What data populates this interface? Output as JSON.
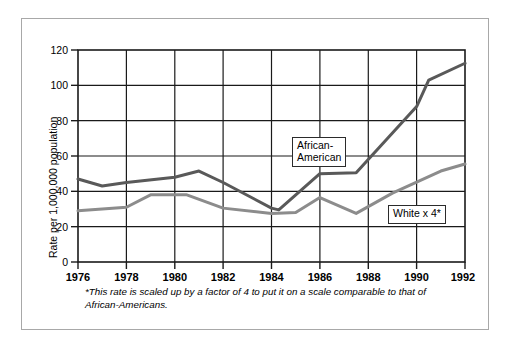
{
  "chart_data": {
    "type": "line",
    "title": "",
    "xlabel": "",
    "ylabel": "Rate per 1,000,000 population",
    "xlim": [
      1976,
      1992
    ],
    "ylim": [
      0,
      120
    ],
    "grid": true,
    "legend_position": "inline-callouts",
    "yticks": [
      0,
      20,
      40,
      60,
      80,
      100,
      120
    ],
    "xticks": [
      1976,
      1978,
      1980,
      1982,
      1984,
      1986,
      1988,
      1990,
      1992
    ],
    "series": [
      {
        "name": "African-American",
        "color": "#595959",
        "x": [
          1976,
          1977,
          1978,
          1980,
          1981,
          1982,
          1984,
          1984.3,
          1986,
          1987.5,
          1988,
          1990,
          1990.5,
          1992
        ],
        "values": [
          47,
          43,
          45,
          48,
          51.5,
          45,
          30.5,
          29.5,
          50,
          50.5,
          58,
          88,
          103,
          112.5
        ]
      },
      {
        "name": "White x 4*",
        "color": "#8c8c8c",
        "x": [
          1976,
          1978,
          1979,
          1980.5,
          1982,
          1984,
          1985,
          1986,
          1987.5,
          1989,
          1991,
          1992
        ],
        "values": [
          29,
          31,
          38,
          38,
          30.5,
          27.5,
          28,
          36.5,
          27.5,
          39,
          51.5,
          55.5
        ]
      }
    ],
    "annotations": [
      {
        "id": "african-american",
        "text": "African-\nAmerican"
      },
      {
        "id": "white-x4",
        "text": "White x 4*"
      }
    ],
    "footnote": "*This rate is scaled up by a factor of 4 to put it on a scale comparable to that of African-Americans."
  }
}
